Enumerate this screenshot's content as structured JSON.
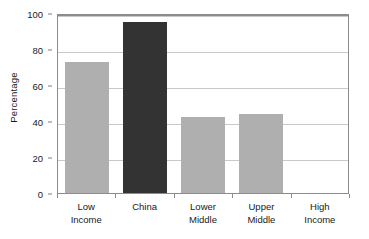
{
  "chart_data": {
    "type": "bar",
    "title": "",
    "xlabel": "",
    "ylabel": "Percentage",
    "categories": [
      "Low Income",
      "China",
      "Lower Middle",
      "Upper Middle",
      "High Income"
    ],
    "category_lines": [
      [
        "Low",
        "Income"
      ],
      [
        "China"
      ],
      [
        "Lower",
        "Middle"
      ],
      [
        "Upper",
        "Middle"
      ],
      [
        "High",
        "Income"
      ]
    ],
    "values": [
      73,
      95,
      42,
      44,
      0
    ],
    "ylim": [
      0,
      100
    ],
    "yticks": [
      0,
      20,
      40,
      60,
      80,
      100
    ],
    "ytick_labels": [
      "0",
      "20",
      "40",
      "60",
      "80",
      "100"
    ],
    "grid": "horizontal",
    "legend": "none",
    "bar_colors": [
      "#afafaf",
      "#333333",
      "#afafaf",
      "#afafaf",
      "#afafaf"
    ],
    "highlight_category": "China"
  },
  "colors": {
    "bar_default": "#afafaf",
    "bar_highlight": "#333333",
    "gridline": "#c9c9c9",
    "axis": "#8c8c8c",
    "text": "#1a1a1a",
    "background": "#ffffff"
  }
}
